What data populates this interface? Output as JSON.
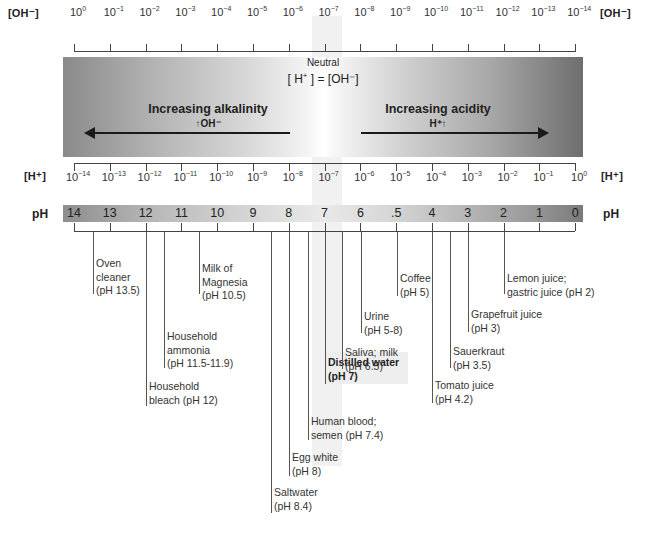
{
  "oh_axis": {
    "label_left": "[OH⁻]",
    "label_right": "[OH⁻]",
    "ticks": [
      {
        "base": "10",
        "exp": "0"
      },
      {
        "base": "10",
        "exp": "−1"
      },
      {
        "base": "10",
        "exp": "−2"
      },
      {
        "base": "10",
        "exp": "−3"
      },
      {
        "base": "10",
        "exp": "−4"
      },
      {
        "base": "10",
        "exp": "−5"
      },
      {
        "base": "10",
        "exp": "−6"
      },
      {
        "base": "10",
        "exp": "−7"
      },
      {
        "base": "10",
        "exp": "−8"
      },
      {
        "base": "10",
        "exp": "−9"
      },
      {
        "base": "10",
        "exp": "−10"
      },
      {
        "base": "10",
        "exp": "−11"
      },
      {
        "base": "10",
        "exp": "−12"
      },
      {
        "base": "10",
        "exp": "−13"
      },
      {
        "base": "10",
        "exp": "−14"
      }
    ]
  },
  "gradient": {
    "neutral_title": "Neutral",
    "neutral_eq_left": "[ H",
    "neutral_eq_sup": "+",
    "neutral_eq_right": " ] = [OH⁻]",
    "left_title": "Increasing alkalinity",
    "left_sub": "↑OH⁻",
    "right_title": "Increasing acidity",
    "right_sub": "H⁺↑"
  },
  "h_axis": {
    "label_left": "[H⁺]",
    "label_right": "[H⁺]",
    "ticks": [
      {
        "base": "10",
        "exp": "−14"
      },
      {
        "base": "10",
        "exp": "−13"
      },
      {
        "base": "10",
        "exp": "−12"
      },
      {
        "base": "10",
        "exp": "−11"
      },
      {
        "base": "10",
        "exp": "−10"
      },
      {
        "base": "10",
        "exp": "−9"
      },
      {
        "base": "10",
        "exp": "−8"
      },
      {
        "base": "10",
        "exp": "−7"
      },
      {
        "base": "10",
        "exp": "−6"
      },
      {
        "base": "10",
        "exp": "−5"
      },
      {
        "base": "10",
        "exp": "−4"
      },
      {
        "base": "10",
        "exp": "−3"
      },
      {
        "base": "10",
        "exp": "−2"
      },
      {
        "base": "10",
        "exp": "−1"
      },
      {
        "base": "10",
        "exp": "0"
      }
    ]
  },
  "ph_scale": {
    "label_left": "pH",
    "label_right": "pH",
    "values": [
      "14",
      "13",
      "12",
      "11",
      "10",
      "9",
      "8",
      "7",
      "6",
      ".5",
      "4",
      "3",
      "2",
      "1",
      "0"
    ]
  },
  "examples": [
    {
      "line1": "Oven",
      "line2": "cleaner",
      "line3": "(pH 13.5)",
      "ph": 13.5
    },
    {
      "line1": "Household",
      "line2": "bleach (pH 12)",
      "line3": "",
      "ph": 12
    },
    {
      "line1": "Household",
      "line2": "ammonia",
      "line3": "(pH 11.5-11.9)",
      "ph": 11.5
    },
    {
      "line1": "Milk of",
      "line2": "Magnesia",
      "line3": "(pH 10.5)",
      "ph": 10.5
    },
    {
      "line1": "Saltwater",
      "line2": "(pH 8.4)",
      "line3": "",
      "ph": 8.4
    },
    {
      "line1": "Egg white",
      "line2": "(pH 8)",
      "line3": "",
      "ph": 8
    },
    {
      "line1": "Human blood;",
      "line2": "semen (pH 7.4)",
      "line3": "",
      "ph": 7.4
    },
    {
      "line1": "Distilled water",
      "line2": "(pH 7)",
      "line3": "",
      "ph": 7
    },
    {
      "line1": "Saliva; milk",
      "line2": "(pH 6.5)",
      "line3": "",
      "ph": 6.5
    },
    {
      "line1": "Urine",
      "line2": "(pH 5-8)",
      "line3": "",
      "ph": 6
    },
    {
      "line1": "Coffee",
      "line2": "(pH 5)",
      "line3": "",
      "ph": 5
    },
    {
      "line1": "Tomato juice",
      "line2": "(pH 4.2)",
      "line3": "",
      "ph": 4
    },
    {
      "line1": "Sauerkraut",
      "line2": "(pH 3.5)",
      "line3": "",
      "ph": 3.5
    },
    {
      "line1": "Grapefruit juice",
      "line2": "(pH 3)",
      "line3": "",
      "ph": 3
    },
    {
      "line1": "Lemon juice;",
      "line2": "gastric juice (pH 2)",
      "line3": "",
      "ph": 2
    }
  ]
}
